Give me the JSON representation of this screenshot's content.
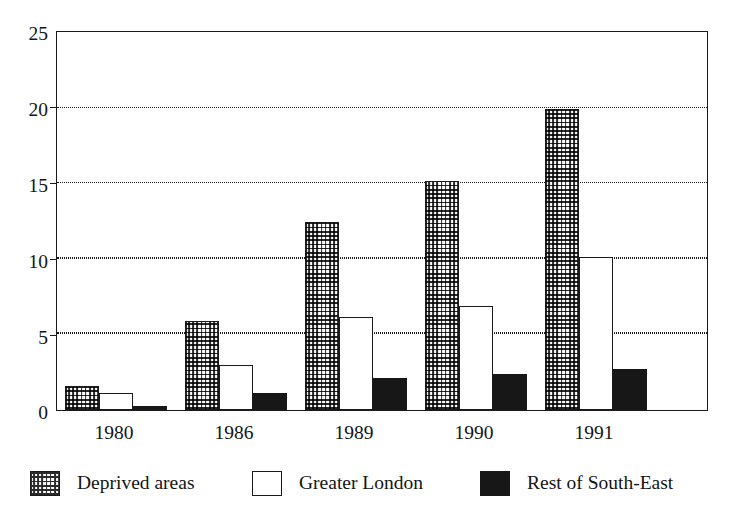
{
  "chart_data": {
    "type": "bar",
    "title": "",
    "xlabel": "",
    "ylabel": "",
    "categories": [
      "1980",
      "1986",
      "1989",
      "1990",
      "1991"
    ],
    "series": [
      {
        "name": "Deprived areas",
        "pattern": "dotted",
        "values": [
          1.6,
          5.9,
          12.5,
          15.2,
          20.0
        ]
      },
      {
        "name": "Greater London",
        "pattern": "white",
        "values": [
          1.1,
          3.0,
          6.2,
          6.9,
          10.2
        ]
      },
      {
        "name": "Rest of South-East",
        "pattern": "solid-black",
        "values": [
          0.25,
          1.1,
          2.1,
          2.4,
          2.7
        ]
      }
    ],
    "ylim": [
      0,
      25
    ],
    "yticks": [
      "0",
      "5",
      "10",
      "15",
      "20",
      "25"
    ],
    "ytick_values": [
      0,
      5,
      10,
      15,
      20,
      25
    ],
    "grid": "horizontal-dotted",
    "gridline_values": [
      5,
      10,
      15,
      20
    ],
    "legend_position": "bottom",
    "colors": {
      "axis": "#1a1a1a",
      "text": "#141414",
      "background": "#ffffff",
      "series_deprived": "#ffffff",
      "series_london": "#ffffff",
      "series_southeast": "#171717"
    }
  },
  "legend": {
    "items": [
      {
        "label": "Deprived areas",
        "swatch": "dotted-pattern-swatch"
      },
      {
        "label": "Greater London",
        "swatch": "white-swatch"
      },
      {
        "label": "Rest of South-East",
        "swatch": "black-swatch"
      }
    ]
  }
}
